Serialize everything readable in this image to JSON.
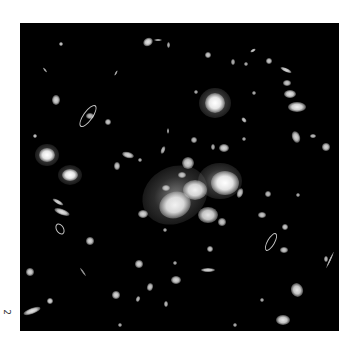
{
  "figure": {
    "panel_label": "2",
    "background_color": "#000000",
    "object_color": "#f2f2f2",
    "frame": {
      "left": 20,
      "top": 23,
      "width": 319,
      "height": 308
    }
  },
  "cluster_halos": [
    {
      "x": 175,
      "y": 195,
      "rx": 34,
      "ry": 28,
      "rot": -30,
      "alpha": 0.55
    },
    {
      "x": 220,
      "y": 181,
      "rx": 22,
      "ry": 18,
      "rot": 0,
      "alpha": 0.6
    },
    {
      "x": 215,
      "y": 103,
      "rx": 16,
      "ry": 15,
      "rot": 0,
      "alpha": 0.65
    },
    {
      "x": 47,
      "y": 155,
      "rx": 12,
      "ry": 11,
      "rot": 0,
      "alpha": 0.6
    },
    {
      "x": 70,
      "y": 175,
      "rx": 12,
      "ry": 10,
      "rot": 0,
      "alpha": 0.55
    }
  ],
  "galaxies": [
    {
      "x": 175,
      "y": 205,
      "rx": 16,
      "ry": 13,
      "rot": -20,
      "b": 0.95
    },
    {
      "x": 195,
      "y": 190,
      "rx": 12,
      "ry": 10,
      "rot": 0,
      "b": 0.95
    },
    {
      "x": 225,
      "y": 183,
      "rx": 14,
      "ry": 12,
      "rot": 0,
      "b": 1
    },
    {
      "x": 208,
      "y": 215,
      "rx": 10,
      "ry": 8,
      "rot": 0,
      "b": 0.9
    },
    {
      "x": 188,
      "y": 163,
      "rx": 6,
      "ry": 6,
      "rot": 0,
      "b": 0.85
    },
    {
      "x": 182,
      "y": 175,
      "rx": 4,
      "ry": 3,
      "rot": 0,
      "b": 0.8
    },
    {
      "x": 166,
      "y": 188,
      "rx": 4,
      "ry": 3,
      "rot": 0,
      "b": 0.8
    },
    {
      "x": 222,
      "y": 222,
      "rx": 4,
      "ry": 4,
      "rot": 0,
      "b": 0.8
    },
    {
      "x": 240,
      "y": 193,
      "rx": 3,
      "ry": 5,
      "rot": 20,
      "b": 0.8
    },
    {
      "x": 215,
      "y": 103,
      "rx": 10,
      "ry": 10,
      "rot": 0,
      "b": 1
    },
    {
      "x": 47,
      "y": 155,
      "rx": 8,
      "ry": 7,
      "rot": 0,
      "b": 1
    },
    {
      "x": 70,
      "y": 175,
      "rx": 8,
      "ry": 6,
      "rot": 0,
      "b": 1
    },
    {
      "x": 56,
      "y": 100,
      "rx": 4,
      "ry": 5,
      "rot": 0,
      "b": 0.85
    },
    {
      "x": 108,
      "y": 122,
      "rx": 3,
      "ry": 3,
      "rot": 0,
      "b": 0.8
    },
    {
      "x": 90,
      "y": 116,
      "rx": 4,
      "ry": 3,
      "rot": 0,
      "b": 0.75
    },
    {
      "x": 128,
      "y": 155,
      "rx": 6,
      "ry": 3,
      "rot": 15,
      "b": 0.85
    },
    {
      "x": 117,
      "y": 166,
      "rx": 3,
      "ry": 4,
      "rot": 0,
      "b": 0.8
    },
    {
      "x": 35,
      "y": 136,
      "rx": 2,
      "ry": 2,
      "rot": 0,
      "b": 0.8
    },
    {
      "x": 148,
      "y": 42,
      "rx": 5,
      "ry": 4,
      "rot": -30,
      "b": 0.9
    },
    {
      "x": 158,
      "y": 40,
      "rx": 4,
      "ry": 1,
      "rot": 0,
      "b": 0.7
    },
    {
      "x": 168,
      "y": 45,
      "rx": 1.5,
      "ry": 3,
      "rot": 0,
      "b": 0.7
    },
    {
      "x": 61,
      "y": 44,
      "rx": 2,
      "ry": 2,
      "rot": 0,
      "b": 0.8
    },
    {
      "x": 45,
      "y": 70,
      "rx": 1,
      "ry": 3,
      "rot": -40,
      "b": 0.7
    },
    {
      "x": 116,
      "y": 73,
      "rx": 1,
      "ry": 3,
      "rot": 30,
      "b": 0.7
    },
    {
      "x": 208,
      "y": 55,
      "rx": 3,
      "ry": 3,
      "rot": 0,
      "b": 0.8
    },
    {
      "x": 253,
      "y": 50,
      "rx": 3,
      "ry": 1.5,
      "rot": -30,
      "b": 0.8
    },
    {
      "x": 269,
      "y": 61,
      "rx": 3,
      "ry": 3,
      "rot": 0,
      "b": 0.8
    },
    {
      "x": 286,
      "y": 70,
      "rx": 6,
      "ry": 2,
      "rot": 25,
      "b": 0.85
    },
    {
      "x": 287,
      "y": 83,
      "rx": 4,
      "ry": 3,
      "rot": 0,
      "b": 0.8
    },
    {
      "x": 290,
      "y": 94,
      "rx": 6,
      "ry": 4,
      "rot": 0,
      "b": 0.9
    },
    {
      "x": 297,
      "y": 107,
      "rx": 9,
      "ry": 5,
      "rot": 0,
      "b": 0.95
    },
    {
      "x": 296,
      "y": 137,
      "rx": 4,
      "ry": 6,
      "rot": -20,
      "b": 0.85
    },
    {
      "x": 313,
      "y": 136,
      "rx": 3,
      "ry": 2,
      "rot": 0,
      "b": 0.75
    },
    {
      "x": 326,
      "y": 147,
      "rx": 4,
      "ry": 4,
      "rot": 0,
      "b": 0.85
    },
    {
      "x": 244,
      "y": 120,
      "rx": 2,
      "ry": 3,
      "rot": -40,
      "b": 0.8
    },
    {
      "x": 244,
      "y": 139,
      "rx": 2,
      "ry": 2,
      "rot": 0,
      "b": 0.7
    },
    {
      "x": 224,
      "y": 148,
      "rx": 5,
      "ry": 4,
      "rot": 0,
      "b": 0.85
    },
    {
      "x": 194,
      "y": 140,
      "rx": 3,
      "ry": 3,
      "rot": 0,
      "b": 0.75
    },
    {
      "x": 213,
      "y": 147,
      "rx": 2,
      "ry": 3,
      "rot": 0,
      "b": 0.7
    },
    {
      "x": 168,
      "y": 131,
      "rx": 1,
      "ry": 3,
      "rot": 0,
      "b": 0.7
    },
    {
      "x": 163,
      "y": 150,
      "rx": 2,
      "ry": 4,
      "rot": 20,
      "b": 0.75
    },
    {
      "x": 140,
      "y": 160,
      "rx": 2,
      "ry": 2,
      "rot": 0,
      "b": 0.7
    },
    {
      "x": 233,
      "y": 62,
      "rx": 2,
      "ry": 3,
      "rot": 0,
      "b": 0.7
    },
    {
      "x": 246,
      "y": 64,
      "rx": 2,
      "ry": 2,
      "rot": 0,
      "b": 0.7
    },
    {
      "x": 254,
      "y": 93,
      "rx": 2,
      "ry": 2,
      "rot": 0,
      "b": 0.7
    },
    {
      "x": 196,
      "y": 92,
      "rx": 2,
      "ry": 2,
      "rot": 0,
      "b": 0.7
    },
    {
      "x": 165,
      "y": 230,
      "rx": 2,
      "ry": 2,
      "rot": 0,
      "b": 0.7
    },
    {
      "x": 62,
      "y": 212,
      "rx": 8,
      "ry": 3,
      "rot": 20,
      "b": 0.9
    },
    {
      "x": 58,
      "y": 202,
      "rx": 6,
      "ry": 2,
      "rot": 30,
      "b": 0.85
    },
    {
      "x": 90,
      "y": 241,
      "rx": 4,
      "ry": 4,
      "rot": 0,
      "b": 0.85
    },
    {
      "x": 30,
      "y": 272,
      "rx": 4,
      "ry": 4,
      "rot": 0,
      "b": 0.85
    },
    {
      "x": 32,
      "y": 311,
      "rx": 9,
      "ry": 3,
      "rot": -20,
      "b": 0.9
    },
    {
      "x": 50,
      "y": 301,
      "rx": 3,
      "ry": 3,
      "rot": 0,
      "b": 0.85
    },
    {
      "x": 116,
      "y": 295,
      "rx": 4,
      "ry": 4,
      "rot": 0,
      "b": 0.85
    },
    {
      "x": 138,
      "y": 299,
      "rx": 2,
      "ry": 3,
      "rot": 20,
      "b": 0.75
    },
    {
      "x": 150,
      "y": 287,
      "rx": 3,
      "ry": 4,
      "rot": 15,
      "b": 0.8
    },
    {
      "x": 166,
      "y": 304,
      "rx": 2,
      "ry": 3,
      "rot": 0,
      "b": 0.75
    },
    {
      "x": 176,
      "y": 280,
      "rx": 5,
      "ry": 4,
      "rot": 0,
      "b": 0.85
    },
    {
      "x": 139,
      "y": 264,
      "rx": 4,
      "ry": 4,
      "rot": 0,
      "b": 0.85
    },
    {
      "x": 143,
      "y": 214,
      "rx": 5,
      "ry": 4,
      "rot": 0,
      "b": 0.85
    },
    {
      "x": 175,
      "y": 263,
      "rx": 2,
      "ry": 2,
      "rot": 0,
      "b": 0.7
    },
    {
      "x": 208,
      "y": 270,
      "rx": 7,
      "ry": 2,
      "rot": 0,
      "b": 0.85
    },
    {
      "x": 210,
      "y": 249,
      "rx": 3,
      "ry": 3,
      "rot": 0,
      "b": 0.8
    },
    {
      "x": 262,
      "y": 215,
      "rx": 4,
      "ry": 3,
      "rot": 0,
      "b": 0.8
    },
    {
      "x": 285,
      "y": 227,
      "rx": 3,
      "ry": 3,
      "rot": 0,
      "b": 0.8
    },
    {
      "x": 284,
      "y": 250,
      "rx": 4,
      "ry": 3,
      "rot": 0,
      "b": 0.8
    },
    {
      "x": 268,
      "y": 194,
      "rx": 3,
      "ry": 3,
      "rot": 0,
      "b": 0.75
    },
    {
      "x": 297,
      "y": 290,
      "rx": 6,
      "ry": 7,
      "rot": -20,
      "b": 0.9
    },
    {
      "x": 283,
      "y": 320,
      "rx": 7,
      "ry": 5,
      "rot": 0,
      "b": 0.9
    },
    {
      "x": 262,
      "y": 300,
      "rx": 2,
      "ry": 2,
      "rot": 0,
      "b": 0.7
    },
    {
      "x": 326,
      "y": 259,
      "rx": 2,
      "ry": 3,
      "rot": 0,
      "b": 0.75
    },
    {
      "x": 330,
      "y": 260,
      "rx": 1,
      "ry": 9,
      "rot": 25,
      "b": 0.75
    },
    {
      "x": 298,
      "y": 195,
      "rx": 2,
      "ry": 2,
      "rot": 0,
      "b": 0.7
    },
    {
      "x": 120,
      "y": 325,
      "rx": 2,
      "ry": 2,
      "rot": 0,
      "b": 0.7
    },
    {
      "x": 235,
      "y": 325,
      "rx": 2,
      "ry": 2,
      "rot": 0,
      "b": 0.7
    },
    {
      "x": 83,
      "y": 272,
      "rx": 1,
      "ry": 5,
      "rot": -35,
      "b": 0.6
    }
  ],
  "arcs": [
    {
      "x": 87,
      "y": 115,
      "rx": 12,
      "ry": 4,
      "rot": -55
    },
    {
      "x": 59,
      "y": 228,
      "rx": 5,
      "ry": 3,
      "rot": 60
    },
    {
      "x": 270,
      "y": 241,
      "rx": 9,
      "ry": 3,
      "rot": -60
    }
  ]
}
